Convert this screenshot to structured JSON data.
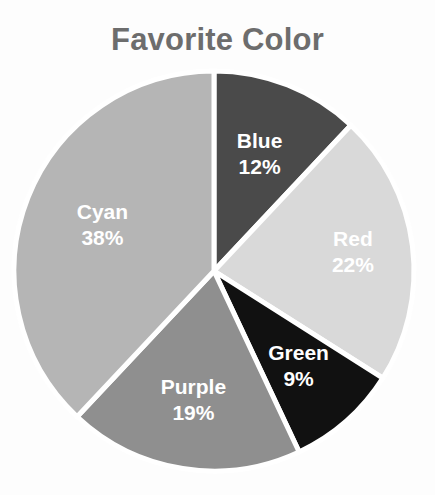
{
  "chart_data": {
    "type": "pie",
    "title": "Favorite Color",
    "xlabel": "",
    "ylabel": "",
    "legend_position": "none",
    "grid": false,
    "labels_inside_slices": true,
    "start_angle_deg": 0,
    "direction": "clockwise",
    "categories": [
      "Blue",
      "Red",
      "Green",
      "Purple",
      "Cyan"
    ],
    "values": [
      12,
      22,
      9,
      19,
      38
    ],
    "value_unit": "%",
    "slices": [
      {
        "label": "Blue",
        "value": 12,
        "value_text": "12%",
        "color": "#4a4a4a",
        "label_color": "#ffffff"
      },
      {
        "label": "Red",
        "value": 22,
        "value_text": "22%",
        "color": "#d9d9d9",
        "label_color": "#ffffff"
      },
      {
        "label": "Green",
        "value": 9,
        "value_text": "9%",
        "color": "#111111",
        "label_color": "#ffffff"
      },
      {
        "label": "Purple",
        "value": 19,
        "value_text": "19%",
        "color": "#8f8f8f",
        "label_color": "#ffffff"
      },
      {
        "label": "Cyan",
        "value": 38,
        "value_text": "38%",
        "color": "#b5b5b5",
        "label_color": "#ffffff"
      }
    ],
    "total": 100,
    "background_color": "#fdfdfd",
    "title_color": "#6d6d6d",
    "slice_border_color": "#ffffff"
  }
}
